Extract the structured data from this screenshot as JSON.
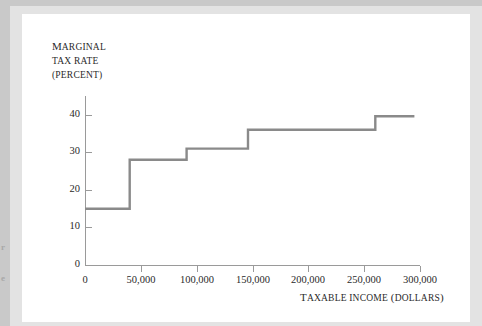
{
  "figure": {
    "axis_color": "#9a9a9a",
    "line_color": "#8a8a8a",
    "page_color": "#ffffff",
    "frame_color": "#e3e3e3",
    "margin_color": "#c9c9c9"
  },
  "gutter": {
    "mark_1": "r",
    "mark_2": "e"
  },
  "y_title": {
    "line1_cap": "M",
    "line1_rest": "ARGINAL",
    "line2": "TAX RATE",
    "line3": "(PERCENT)"
  },
  "x_title": {
    "cap1": "T",
    "rest1": "AXABLE INCOME",
    "cap2": " (",
    "rest2": "DOLLARS",
    "cap3": ")"
  },
  "chart_data": {
    "type": "line",
    "title": "",
    "xlabel": "TAXABLE INCOME (DOLLARS)",
    "ylabel": "MARGINAL TAX RATE (PERCENT)",
    "xlim": [
      0,
      300000
    ],
    "ylim": [
      0,
      45
    ],
    "grid": false,
    "legend": "none",
    "x_ticks": [
      0,
      50000,
      100000,
      150000,
      200000,
      250000,
      300000
    ],
    "x_tick_labels": [
      "0",
      "50,000",
      "100,000",
      "150,000",
      "200,000",
      "250,000",
      "300,000"
    ],
    "y_ticks": [
      0,
      10,
      20,
      30,
      40
    ],
    "y_tick_labels": [
      "0",
      "10",
      "20",
      "30",
      "40"
    ],
    "series": [
      {
        "name": "Marginal tax rate",
        "step": "post",
        "brackets": [
          {
            "from": 0,
            "to": 40000,
            "rate": 15
          },
          {
            "from": 40000,
            "to": 91000,
            "rate": 28
          },
          {
            "from": 91000,
            "to": 146000,
            "rate": 31
          },
          {
            "from": 146000,
            "to": 260000,
            "rate": 36
          },
          {
            "from": 260000,
            "to": 295000,
            "rate": 39.6
          }
        ],
        "x": [
          0,
          40000,
          40000,
          91000,
          91000,
          146000,
          146000,
          260000,
          260000,
          295000
        ],
        "y": [
          15,
          15,
          28,
          28,
          31,
          31,
          36,
          36,
          39.6,
          39.6
        ]
      }
    ]
  }
}
